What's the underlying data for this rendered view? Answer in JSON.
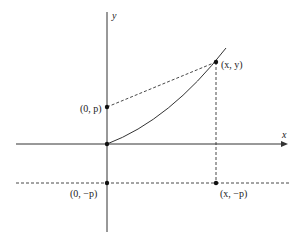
{
  "diagram": {
    "axes": {
      "x_label": "x",
      "y_label": "y"
    },
    "points": {
      "focus": "(0, p)",
      "curve_point": "(x, y)",
      "directrix_y_axis": "(0, −p)",
      "directrix_point": "(x, −p)"
    },
    "colors": {
      "line": "#333333",
      "background": "#ffffff"
    }
  }
}
